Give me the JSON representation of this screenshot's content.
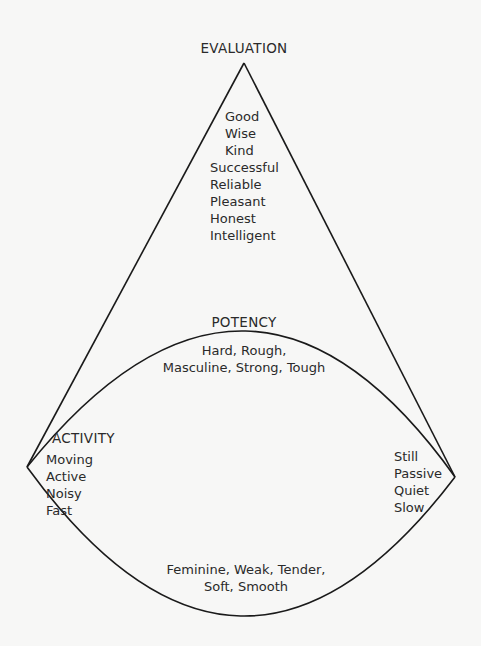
{
  "diagram": {
    "evaluation": {
      "title": "EVALUATION",
      "items": [
        "Good",
        "Wise",
        "Kind",
        "Successful",
        "Reliable",
        "Pleasant",
        "Honest",
        "Intelligent"
      ]
    },
    "potency": {
      "title": "POTENCY",
      "strong_line1": "Hard, Rough,",
      "strong_line2": "Masculine, Strong, Tough",
      "weak_line1": "Feminine, Weak, Tender,",
      "weak_line2": "Soft, Smooth"
    },
    "activity": {
      "title": "ACTIVITY",
      "active_items": [
        "Moving",
        "Active",
        "Noisy",
        "Fast"
      ],
      "passive_items": [
        "Still",
        "Passive",
        "Quiet",
        "Slow"
      ]
    },
    "colors": {
      "line": "#1a1a1a",
      "background": "#f7f7f6",
      "text": "#2a2a2a"
    }
  }
}
